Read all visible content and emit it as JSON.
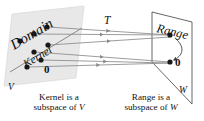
{
  "figure": {
    "domain_plane_label": "Domain",
    "kernel_label": "Kernel",
    "domain_zero_label": "0",
    "domain_space_label": "V",
    "map_label": "T",
    "range_plane_label": "Range",
    "range_zero_label": "0",
    "range_space_label": "W",
    "captions": {
      "left_line1": "Kernel is a",
      "left_line2_prefix": "subspace of ",
      "left_line2_symbol": "V",
      "right_line1": "Range is a",
      "right_line2_prefix": "subspace of ",
      "right_line2_symbol": "W"
    }
  },
  "colors": {
    "background": "#ffffff",
    "domain_plane_fill": "#e8e8e8",
    "domain_plane_stroke": "#d8d8d8",
    "range_plane_fill": "#ffffff",
    "range_plane_stroke": "#555555",
    "arrow_line": "#8a8a8a",
    "dot_fill": "#1a1a1a",
    "text": "#111111",
    "kernel_line": "#6e6e6e"
  },
  "geometry": {
    "domain_plane_points": "12,14 84,6 76,78 4,86",
    "kernel_line": {
      "x1": 10,
      "y1": 72,
      "x2": 82,
      "y2": 28
    },
    "range_plane_points": "152,12 192,22 192,104 152,62",
    "domain_dots": [
      {
        "x": 20,
        "y": 41,
        "r": 2.6
      },
      {
        "x": 34,
        "y": 34,
        "r": 2.6
      },
      {
        "x": 47,
        "y": 27,
        "r": 2.6
      },
      {
        "x": 34,
        "y": 52,
        "r": 2.6
      },
      {
        "x": 48,
        "y": 45,
        "r": 2.6
      },
      {
        "x": 27,
        "y": 67,
        "r": 2.6
      },
      {
        "x": 41,
        "y": 60,
        "r": 2.6
      }
    ],
    "range_dots": [
      {
        "x": 170,
        "y": 35,
        "r": 2.6
      },
      {
        "x": 170,
        "y": 62,
        "r": 2.6
      }
    ],
    "arrows": [
      {
        "x1": 48,
        "y1": 27,
        "x2": 170,
        "y2": 35
      },
      {
        "x1": 35,
        "y1": 34,
        "x2": 170,
        "y2": 35
      },
      {
        "x1": 49,
        "y1": 45,
        "x2": 170,
        "y2": 37
      },
      {
        "x1": 35,
        "y1": 52,
        "x2": 170,
        "y2": 62
      },
      {
        "x1": 42,
        "y1": 60,
        "x2": 170,
        "y2": 63
      },
      {
        "x1": 28,
        "y1": 67,
        "x2": 170,
        "y2": 63
      }
    ],
    "curved_arrow": {
      "path": "M 176 39 C 186 48 182 56 174 60"
    }
  }
}
